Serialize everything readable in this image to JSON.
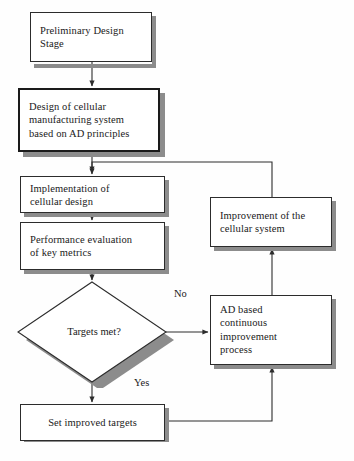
{
  "diagram": {
    "type": "flowchart",
    "colors": {
      "box_fill": "#ffffff",
      "box_stroke": "#2c2c2c",
      "emphasis_stroke": "#1a1a1a",
      "shadow": "#8c8c8c",
      "connector": "#2c2c2c",
      "text": "#1a1a1a",
      "background": "#fefefe"
    },
    "nodes": [
      {
        "id": "preliminary-design-stage",
        "shape": "process",
        "label": "Preliminary Design\nStage",
        "emphasis": false
      },
      {
        "id": "design-of-cellular-manufacturing-system",
        "shape": "process",
        "label": "Design of cellular\nmanufacturing system\nbased on AD principles",
        "emphasis": true
      },
      {
        "id": "implementation-of-cellular-design",
        "shape": "process",
        "label": "Implementation of\ncellular design",
        "emphasis": false
      },
      {
        "id": "performance-evaluation-of-key-metrics",
        "shape": "process",
        "label": "Performance evaluation\nof key metrics",
        "emphasis": false
      },
      {
        "id": "targets-met-decision",
        "shape": "decision",
        "label": "Targets met?",
        "emphasis": false
      },
      {
        "id": "set-improved-targets",
        "shape": "process",
        "label": "Set improved targets",
        "emphasis": false
      },
      {
        "id": "improvement-of-the-cellular-system",
        "shape": "process",
        "label": "Improvement of the\ncellular system",
        "emphasis": false
      },
      {
        "id": "ad-based-continuous-improvement-process",
        "shape": "process",
        "label": "AD based\ncontinuous\nimprovement\nprocess",
        "emphasis": false
      }
    ],
    "edge_labels": {
      "no": "No",
      "yes": "Yes"
    },
    "edges": [
      {
        "from": "preliminary-design-stage",
        "to": "design-of-cellular-manufacturing-system",
        "label": ""
      },
      {
        "from": "design-of-cellular-manufacturing-system",
        "to": "implementation-of-cellular-design",
        "label": ""
      },
      {
        "from": "implementation-of-cellular-design",
        "to": "performance-evaluation-of-key-metrics",
        "label": ""
      },
      {
        "from": "performance-evaluation-of-key-metrics",
        "to": "targets-met-decision",
        "label": ""
      },
      {
        "from": "targets-met-decision",
        "to": "ad-based-continuous-improvement-process",
        "label": "No"
      },
      {
        "from": "targets-met-decision",
        "to": "set-improved-targets",
        "label": "Yes"
      },
      {
        "from": "set-improved-targets",
        "to": "ad-based-continuous-improvement-process",
        "label": ""
      },
      {
        "from": "ad-based-continuous-improvement-process",
        "to": "improvement-of-the-cellular-system",
        "label": ""
      },
      {
        "from": "improvement-of-the-cellular-system",
        "to": "implementation-of-cellular-design",
        "label": ""
      }
    ]
  }
}
